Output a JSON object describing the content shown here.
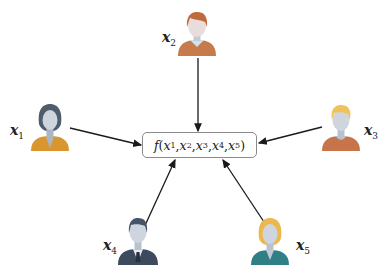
{
  "diagram": {
    "type": "star-aggregation",
    "center_function": {
      "name": "f",
      "args": [
        "x1",
        "x2",
        "x3",
        "x4",
        "x5"
      ],
      "text_prefix": "f(",
      "text_suffix": ")"
    },
    "nodes": [
      {
        "id": "x1",
        "var": "x",
        "sub": "1",
        "position": "left",
        "hair_color": "#4e5d6c",
        "shirt_color": "#d9962e"
      },
      {
        "id": "x2",
        "var": "x",
        "sub": "2",
        "position": "top",
        "hair_color": "#c06a3c",
        "shirt_color": "#c77a4b"
      },
      {
        "id": "x3",
        "var": "x",
        "sub": "3",
        "position": "right",
        "hair_color": "#efc35a",
        "shirt_color": "#c7744a"
      },
      {
        "id": "x4",
        "var": "x",
        "sub": "4",
        "position": "bottom-left",
        "hair_color": "#45546a",
        "shirt_color": "#3d4a5e"
      },
      {
        "id": "x5",
        "var": "x",
        "sub": "5",
        "position": "bottom-right",
        "hair_color": "#eab84e",
        "shirt_color": "#2f7f86"
      }
    ],
    "edges": [
      {
        "from": "x1",
        "to": "f"
      },
      {
        "from": "x2",
        "to": "f"
      },
      {
        "from": "x3",
        "to": "f"
      },
      {
        "from": "x4",
        "to": "f"
      },
      {
        "from": "x5",
        "to": "f"
      }
    ],
    "colors": {
      "arrow": "#1a1a1a",
      "box_border": "#8a8a8a",
      "face": "#cfd5de"
    }
  },
  "labels": {
    "x1": {
      "var": "x",
      "sub": "1"
    },
    "x2": {
      "var": "x",
      "sub": "2"
    },
    "x3": {
      "var": "x",
      "sub": "3"
    },
    "x4": {
      "var": "x",
      "sub": "4"
    },
    "x5": {
      "var": "x",
      "sub": "5"
    }
  },
  "function_box": {
    "f": "f",
    "open": "(",
    "close": ")",
    "args": [
      {
        "var": "x",
        "sub": "1"
      },
      {
        "var": "x",
        "sub": "2"
      },
      {
        "var": "x",
        "sub": "3"
      },
      {
        "var": "x",
        "sub": "4"
      },
      {
        "var": "x",
        "sub": "5"
      }
    ],
    "sep": ", "
  }
}
